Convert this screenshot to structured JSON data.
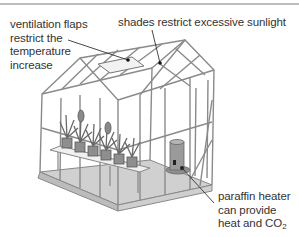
{
  "diagram": {
    "labels": {
      "ventilation": {
        "lines": [
          "ventilation flaps",
          "restrict the",
          "temperature",
          "increase"
        ]
      },
      "shades": {
        "text": "shades restrict excessive sunlight"
      },
      "heater": {
        "lines": [
          "paraffin heater",
          "can provide",
          "heat and CO"
        ],
        "subscript": "2"
      }
    },
    "colors": {
      "frame": "#8a8a8a",
      "floor": "#c8c8c8",
      "text": "#333333",
      "rule": "#bdbdbd"
    }
  }
}
